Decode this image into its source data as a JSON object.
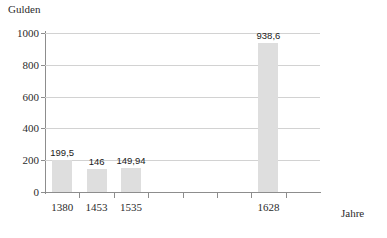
{
  "chart_data": {
    "type": "bar",
    "title": "",
    "ylabel": "Gulden",
    "xlabel": "Jahre",
    "categories": [
      "1380",
      "1453",
      "1535",
      "1628"
    ],
    "values": [
      199.5,
      146,
      149.94,
      938.6
    ],
    "value_labels": [
      "199,5",
      "146",
      "149,94",
      "938,6"
    ],
    "ylim": [
      0,
      1000
    ],
    "ytick_labels": [
      "0",
      "200",
      "400",
      "600",
      "800",
      "1000"
    ],
    "ytick_values": [
      0,
      200,
      400,
      600,
      800,
      1000
    ],
    "grid": true,
    "legend": "none",
    "slot_count": 8,
    "bar_slots": [
      1,
      2,
      3,
      7
    ],
    "colors": {
      "bar_fill": "#dedede",
      "axis": "#8d8d8d",
      "gridline": "#d2d2d2",
      "text": "#2b2b2b"
    }
  }
}
